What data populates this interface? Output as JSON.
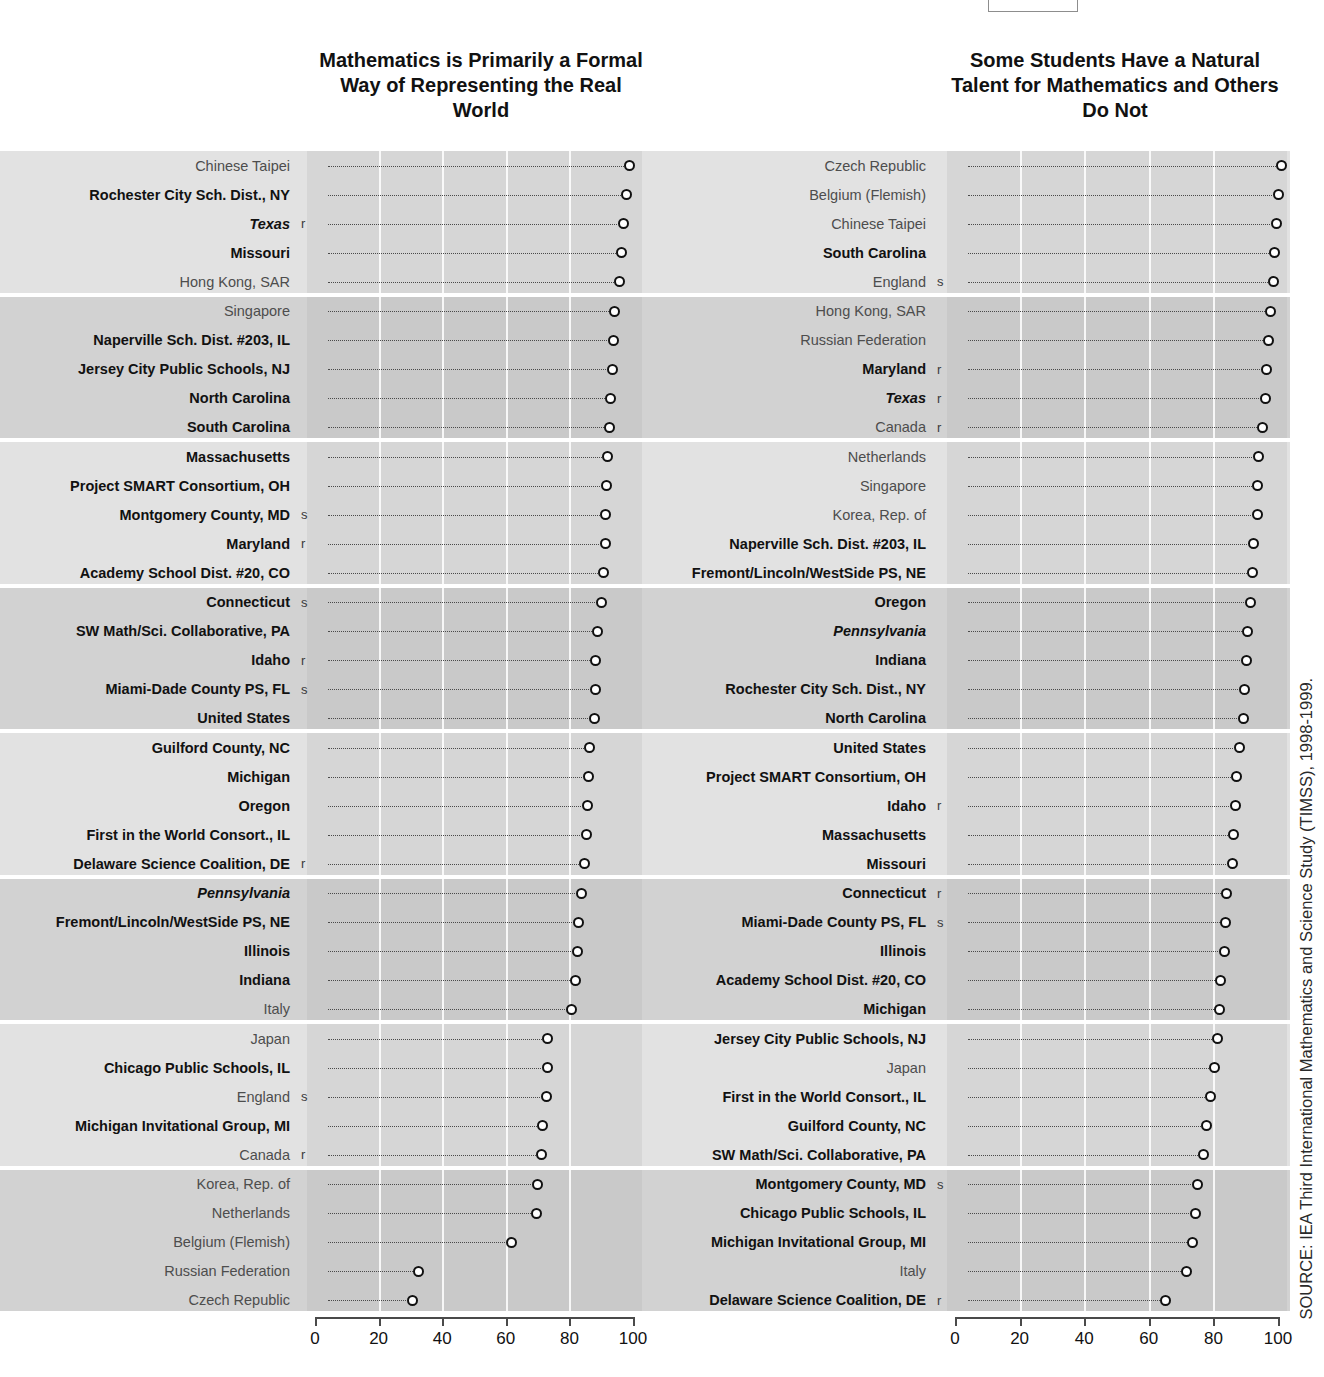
{
  "source_note": "SOURCE: IEA Third International Mathematics and Science Study (TIMSS), 1998-1999.",
  "axis": {
    "ticks": [
      "0",
      "20",
      "40",
      "60",
      "80",
      "100"
    ],
    "min": 0,
    "max": 100
  },
  "chart_data": [
    {
      "type": "scatter",
      "title": "Mathematics is Primarily a Formal Way of Representing the Real World",
      "xlabel": "",
      "ylabel": "",
      "xlim": [
        0,
        100
      ],
      "grid": true,
      "legend": "none",
      "categories": [
        "Chinese Taipei",
        "Rochester City Sch. Dist., NY",
        "Texas",
        "Missouri",
        "Hong Kong, SAR",
        "Singapore",
        "Naperville Sch. Dist. #203, IL",
        "Jersey City Public Schools, NJ",
        "North Carolina",
        "South Carolina",
        "Massachusetts",
        "Project SMART Consortium, OH",
        "Montgomery County, MD",
        "Maryland",
        "Academy School Dist. #20, CO",
        "Connecticut",
        "SW Math/Sci. Collaborative, PA",
        "Idaho",
        "Miami-Dade County PS, FL",
        "United States",
        "Guilford County, NC",
        "Michigan",
        "Oregon",
        "First in the World Consort., IL",
        "Delaware Science Coalition, DE",
        "Pennsylvania",
        "Fremont/Lincoln/WestSide PS, NE",
        "Illinois",
        "Indiana",
        "Italy",
        "Japan",
        "Chicago Public Schools, IL",
        "England",
        "Michigan Invitational Group, MI",
        "Canada",
        "Korea, Rep. of",
        "Netherlands",
        "Belgium (Flemish)",
        "Russian Federation",
        "Czech Republic"
      ],
      "values": [
        95.5,
        94.6,
        93.5,
        93.0,
        92.4,
        90.8,
        90.4,
        90.0,
        89.6,
        89.3,
        88.6,
        88.2,
        88.0,
        87.8,
        87.3,
        86.5,
        85.4,
        84.9,
        84.6,
        84.3,
        83.0,
        82.5,
        82.2,
        81.8,
        81.4,
        80.3,
        79.3,
        79.0,
        78.6,
        77.2,
        69.8,
        69.5,
        69.2,
        68.2,
        67.8,
        66.5,
        66.2,
        58.3,
        29.2,
        27.2
      ],
      "flags": [
        "",
        "",
        "r",
        "",
        "",
        "",
        "",
        "",
        "",
        "",
        "",
        "",
        "s",
        "r",
        "",
        "s",
        "",
        "r",
        "s",
        "",
        "",
        "",
        "",
        "",
        "r",
        "",
        "",
        "",
        "",
        "",
        "",
        "",
        "s",
        "",
        "r",
        "",
        "",
        "",
        "",
        ""
      ],
      "styles": [
        "plain",
        "bold",
        "italic",
        "bold",
        "plain",
        "plain",
        "bold",
        "bold",
        "bold",
        "bold",
        "bold",
        "bold",
        "bold",
        "bold",
        "bold",
        "bold",
        "bold",
        "bold",
        "bold",
        "bold",
        "bold",
        "bold",
        "bold",
        "bold",
        "bold",
        "italic",
        "bold",
        "bold",
        "bold",
        "plain",
        "plain",
        "bold",
        "plain",
        "bold",
        "plain",
        "plain",
        "plain",
        "plain",
        "plain",
        "plain"
      ]
    },
    {
      "type": "scatter",
      "title": "Some Students Have a Natural Talent for Mathematics and Others Do Not",
      "xlabel": "",
      "ylabel": "",
      "xlim": [
        0,
        100
      ],
      "grid": true,
      "legend": "none",
      "categories": [
        "Czech Republic",
        "Belgium (Flemish)",
        "Chinese Taipei",
        "South Carolina",
        "England",
        "Hong Kong, SAR",
        "Russian Federation",
        "Maryland",
        "Texas",
        "Canada",
        "Netherlands",
        "Singapore",
        "Korea, Rep. of",
        "Naperville Sch. Dist. #203, IL",
        "Fremont/Lincoln/WestSide PS, NE",
        "Oregon",
        "Pennsylvania",
        "Indiana",
        "Rochester City Sch. Dist., NY",
        "North Carolina",
        "United States",
        "Project SMART Consortium, OH",
        "Idaho",
        "Massachusetts",
        "Missouri",
        "Connecticut",
        "Miami-Dade County PS, FL",
        "Illinois",
        "Academy School Dist. #20, CO",
        "Michigan",
        "Jersey City Public Schools, NJ",
        "Japan",
        "First in the World Consort., IL",
        "Guilford County, NC",
        "SW Math/Sci. Collaborative, PA",
        "Montgomery County, MD",
        "Chicago Public Schools, IL",
        "Michigan Invitational Group, MI",
        "Italy",
        "Delaware Science Coalition, DE"
      ],
      "values": [
        97.8,
        96.6,
        96.0,
        95.6,
        95.3,
        94.4,
        93.8,
        93.0,
        92.6,
        91.8,
        90.5,
        90.3,
        90.1,
        89.0,
        88.7,
        88.0,
        87.3,
        86.8,
        86.2,
        85.8,
        84.6,
        83.9,
        83.3,
        82.9,
        82.4,
        80.8,
        80.4,
        80.0,
        78.9,
        78.6,
        77.9,
        77.0,
        75.8,
        74.6,
        73.6,
        71.6,
        71.0,
        70.2,
        68.4,
        61.8
      ],
      "flags": [
        "",
        "",
        "",
        "",
        "s",
        "",
        "",
        "r",
        "r",
        "r",
        "",
        "",
        "",
        "",
        "",
        "",
        "",
        "",
        "",
        "",
        "",
        "",
        "r",
        "",
        "",
        "r",
        "s",
        "",
        "",
        "",
        "",
        "",
        "",
        "",
        "",
        "s",
        "",
        "",
        "",
        "r"
      ],
      "styles": [
        "plain",
        "plain",
        "plain",
        "bold",
        "plain",
        "plain",
        "plain",
        "bold",
        "italic",
        "plain",
        "plain",
        "plain",
        "plain",
        "bold",
        "bold",
        "bold",
        "italic",
        "bold",
        "bold",
        "bold",
        "bold",
        "bold",
        "bold",
        "bold",
        "bold",
        "bold",
        "bold",
        "bold",
        "bold",
        "bold",
        "bold",
        "plain",
        "bold",
        "bold",
        "bold",
        "bold",
        "bold",
        "bold",
        "plain",
        "bold"
      ]
    }
  ]
}
